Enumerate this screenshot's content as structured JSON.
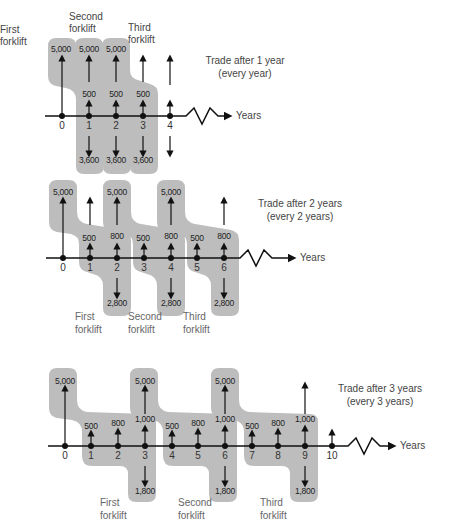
{
  "panels": [
    {
      "title_line1": "Trade after 1 year",
      "title_line2": "(every year)",
      "axis_label": "Years",
      "ticks": [
        "0",
        "1",
        "2",
        "3",
        "4"
      ],
      "forklift_labels": [
        {
          "line1": "First",
          "line2": "forklift"
        },
        {
          "line1": "Second",
          "line2": "forklift"
        },
        {
          "line1": "Third",
          "line2": "forklift"
        }
      ],
      "cash_flows": [
        {
          "year": 0,
          "up": "5,000"
        },
        {
          "year": 1,
          "up": "5,000",
          "up_small": "500",
          "down": "3,600"
        },
        {
          "year": 2,
          "up": "5,000",
          "up_small": "500",
          "down": "3,600"
        },
        {
          "year": 3,
          "up_small": "500",
          "down": "3,600"
        },
        {
          "year": 4
        }
      ],
      "labels": {
        "v0_up": "5,000",
        "v1_up": "5,000",
        "v2_up": "5,000",
        "v1_small": "500",
        "v2_small": "500",
        "v3_small": "500",
        "v1_down": "3,600",
        "v2_down": "3,600",
        "v3_down": "3,600"
      }
    },
    {
      "title_line1": "Trade after 2 years",
      "title_line2": "(every 2 years)",
      "axis_label": "Years",
      "ticks": [
        "0",
        "1",
        "2",
        "3",
        "4",
        "5",
        "6"
      ],
      "forklift_labels": [
        {
          "line1": "First",
          "line2": "forklift"
        },
        {
          "line1": "Second",
          "line2": "forklift"
        },
        {
          "line1": "Third",
          "line2": "forklift"
        }
      ],
      "labels": {
        "v0_up": "5,000",
        "v2_up": "5,000",
        "v4_up": "5,000",
        "v1_small": "500",
        "v2_small": "800",
        "v3_small": "500",
        "v4_small": "800",
        "v5_small": "500",
        "v6_small": "800",
        "v2_down": "2,800",
        "v4_down": "2,800",
        "v6_down": "2,800"
      }
    },
    {
      "title_line1": "Trade after 3 years",
      "title_line2": "(every 3 years)",
      "axis_label": "Years",
      "ticks": [
        "0",
        "1",
        "2",
        "3",
        "4",
        "5",
        "6",
        "7",
        "8",
        "9",
        "10"
      ],
      "forklift_labels": [
        {
          "line1": "First",
          "line2": "forklift"
        },
        {
          "line1": "Second",
          "line2": "forklift"
        },
        {
          "line1": "Third",
          "line2": "forklift"
        }
      ],
      "labels": {
        "v0_up": "5,000",
        "v3_up": "5,000",
        "v6_up": "5,000",
        "v1_small": "500",
        "v2_small": "800",
        "v3_small": "1,000",
        "v4_small": "500",
        "v5_small": "800",
        "v6_small": "1,000",
        "v7_small": "500",
        "v8_small": "800",
        "v9_small": "1,000",
        "v3_down": "1,800",
        "v6_down": "1,800",
        "v9_down": "1,800"
      }
    }
  ],
  "colors": {
    "shade": "#bdbdbd",
    "line": "#111111",
    "text": "#444444"
  }
}
